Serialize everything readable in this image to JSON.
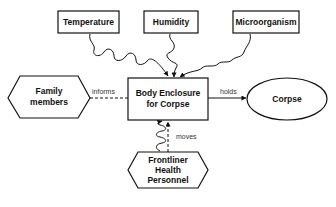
{
  "diagram": {
    "nodes": {
      "temperature": {
        "label": "Temperature",
        "shape": "rectangle"
      },
      "humidity": {
        "label": "Humidity",
        "shape": "rectangle"
      },
      "microorganism": {
        "label": "Microorganism",
        "shape": "rectangle"
      },
      "body_enclosure": {
        "label_line1": "Body Enclosure",
        "label_line2": "for Corpse",
        "shape": "rectangle"
      },
      "family_members": {
        "label_line1": "Family",
        "label_line2": "members",
        "shape": "hexagon"
      },
      "corpse": {
        "label": "Corpse",
        "shape": "ellipse"
      },
      "frontliner": {
        "label_line1": "Frontliner",
        "label_line2": "Health",
        "label_line3": "Personnel",
        "shape": "hexagon"
      }
    },
    "edges": {
      "informs": {
        "label": "informs",
        "from": "Family members",
        "to": "Body Enclosure for Corpse",
        "style": "dashed"
      },
      "holds": {
        "label": "holds",
        "from": "Body Enclosure for Corpse",
        "to": "Corpse",
        "style": "solid"
      },
      "moves": {
        "label": "moves",
        "from": "Frontliner Health Personnel",
        "to": "Body Enclosure for Corpse",
        "style": "dashed"
      },
      "temperature_influence": {
        "from": "Temperature",
        "to": "Body Enclosure for Corpse",
        "style": "wavy"
      },
      "humidity_influence": {
        "from": "Humidity",
        "to": "Body Enclosure for Corpse",
        "style": "wavy"
      },
      "microorganism_influence": {
        "from": "Microorganism",
        "to": "Body Enclosure for Corpse",
        "style": "wavy"
      },
      "frontliner_influence": {
        "from": "Frontliner Health Personnel",
        "to": "Body Enclosure for Corpse",
        "style": "wavy"
      }
    }
  }
}
